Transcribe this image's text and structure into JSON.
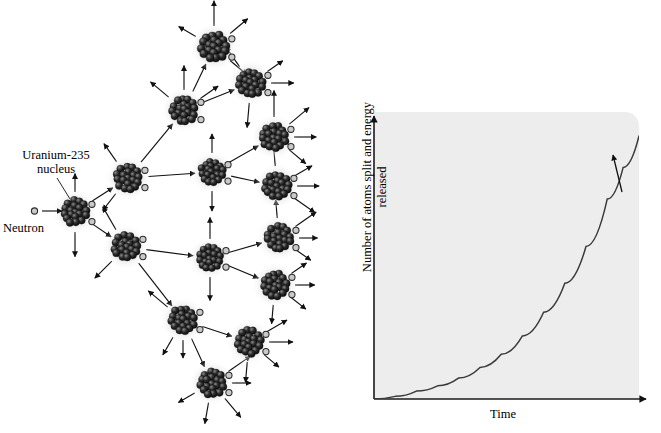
{
  "figure": {
    "left_diagram": {
      "name": "nuclear-fission-chain-reaction",
      "labels": {
        "uranium_line1": "Uranium-235",
        "uranium_line2": "nucleus",
        "neutron": "Neutron"
      },
      "nucleus_count": 16,
      "colors": {
        "nucleon_dark": "#1a1a1a",
        "nucleon_mid": "#3d3d3d",
        "neutron_fill": "#c9c9c9",
        "neutron_stroke": "#2a2a2a",
        "arrow": "#111111",
        "glow": "#d8d8d8"
      },
      "nuclei": [
        {
          "id": "n0",
          "x": 75,
          "y": 212,
          "r": 15,
          "generation": 0
        },
        {
          "id": "n1",
          "x": 128,
          "y": 178,
          "r": 15,
          "generation": 1
        },
        {
          "id": "n2",
          "x": 126,
          "y": 247,
          "r": 15,
          "generation": 1
        },
        {
          "id": "n3",
          "x": 184,
          "y": 110,
          "r": 15,
          "generation": 2
        },
        {
          "id": "n4",
          "x": 212,
          "y": 172,
          "r": 14,
          "generation": 2
        },
        {
          "id": "n5",
          "x": 210,
          "y": 258,
          "r": 14,
          "generation": 2
        },
        {
          "id": "n6",
          "x": 183,
          "y": 320,
          "r": 15,
          "generation": 2
        },
        {
          "id": "n7",
          "x": 214,
          "y": 47,
          "r": 16,
          "generation": 3
        },
        {
          "id": "n8",
          "x": 251,
          "y": 83,
          "r": 15,
          "generation": 3
        },
        {
          "id": "n9",
          "x": 274,
          "y": 137,
          "r": 15,
          "generation": 3
        },
        {
          "id": "n10",
          "x": 277,
          "y": 186,
          "r": 15,
          "generation": 3
        },
        {
          "id": "n11",
          "x": 279,
          "y": 238,
          "r": 15,
          "generation": 3
        },
        {
          "id": "n12",
          "x": 275,
          "y": 285,
          "r": 15,
          "generation": 3
        },
        {
          "id": "n13",
          "x": 249,
          "y": 342,
          "r": 15,
          "generation": 3
        },
        {
          "id": "n14",
          "x": 212,
          "y": 383,
          "r": 15,
          "generation": 3
        }
      ]
    },
    "right_chart": {
      "name": "exponential-growth-chart"
    }
  },
  "chart_data": {
    "type": "line",
    "title": "",
    "xlabel": "Time",
    "ylabel": "Number of atoms split and energy released",
    "xlim": [
      0,
      1
    ],
    "ylim": [
      0,
      1
    ],
    "grid": false,
    "legend": null,
    "axis_ticks": {
      "x": [],
      "y": []
    },
    "annotations": [
      {
        "type": "arrow",
        "label": "",
        "x": 0.92,
        "y": 0.85,
        "note": "upward arrow alongside rising curve"
      }
    ],
    "series": [
      {
        "name": "chain reaction growth",
        "color": "#3a3a3a",
        "x": [
          0.0,
          0.08,
          0.16,
          0.24,
          0.32,
          0.4,
          0.48,
          0.56,
          0.64,
          0.72,
          0.8,
          0.88,
          0.94,
          1.0
        ],
        "y": [
          0.0,
          0.01,
          0.03,
          0.05,
          0.08,
          0.12,
          0.17,
          0.24,
          0.33,
          0.44,
          0.58,
          0.76,
          0.88,
          1.0
        ]
      }
    ]
  }
}
